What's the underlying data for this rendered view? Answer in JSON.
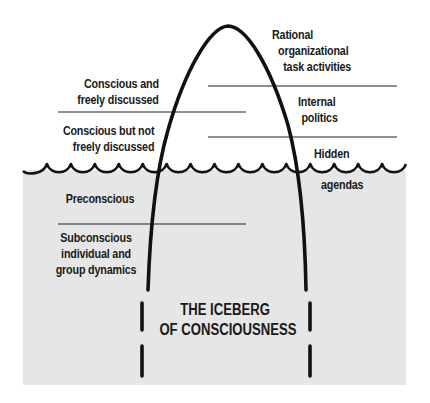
{
  "title": {
    "line1": "THE ICEBERG",
    "line2": "OF CONSCIOUSNESS"
  },
  "left_labels": {
    "conscious_discussed": [
      "Conscious and",
      "freely discussed"
    ],
    "conscious_not_discussed": [
      "Conscious but not",
      "freely discussed"
    ],
    "preconscious": [
      "Preconscious"
    ],
    "subconscious": [
      "Subconscious",
      "individual and",
      "group dynamics"
    ]
  },
  "right_labels": {
    "rational": [
      "Rational",
      "organizational",
      "task activities"
    ],
    "internal_politics": [
      "Internal",
      "politics"
    ],
    "hidden_agendas_above": "Hidden",
    "hidden_agendas_below": "agendas"
  },
  "colors": {
    "water": "#e6e6e6",
    "ink": "#111111",
    "background": "#ffffff"
  }
}
